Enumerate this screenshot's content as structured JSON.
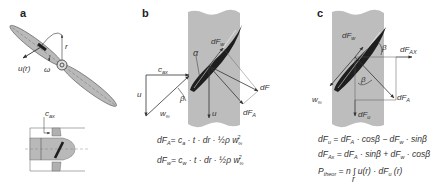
{
  "panels": {
    "a": {
      "label": "a",
      "labels": {
        "u": "u(r)",
        "omega": "ω",
        "r": "r",
        "cax": "c",
        "cax_sub": "ax"
      }
    },
    "b": {
      "label": "b",
      "labels": {
        "alpha": "α",
        "beta": "β",
        "dFw": "dF",
        "dFw_sub": "w",
        "dF": "dF",
        "dFA": "dF",
        "dFA_sub": "A",
        "cax": "c",
        "cax_sub": "ax",
        "u_left": "u",
        "u_blade": "u",
        "winf": "w",
        "winf_sub": "∞"
      },
      "equations": [
        {
          "lhs": "dF",
          "lhs_sub": "A",
          "rhs": "= c",
          "coef_sub": "a",
          "tail": " · t · dr · ",
          "half": "½",
          "rho": "ρ w",
          "w_sub": "∞",
          "w_sup": "2"
        },
        {
          "lhs": "dF",
          "lhs_sub": "w",
          "rhs": "= c",
          "coef_sub": "w",
          "tail": " · t · dr · ",
          "half": "½",
          "rho": "ρ w",
          "w_sub": "∞",
          "w_sup": "2"
        }
      ]
    },
    "c": {
      "label": "c",
      "labels": {
        "dFw": "dF",
        "dFw_sub": "w",
        "beta_top": "β",
        "dFAx": "dF",
        "dFAx_sub": "AX",
        "beta": "β",
        "winf": "w",
        "winf_sub": "∞",
        "dFA": "dF",
        "dFA_sub": "A",
        "dFu": "dF",
        "dFu_sub": "u"
      },
      "equations": [
        {
          "text": "dF",
          "sub1": "u",
          "rest": " = dF",
          "sub2": "A",
          "rest2": " · cosβ − dF",
          "sub3": "w",
          "rest3": " · sinβ"
        },
        {
          "text": "dF",
          "sub1": "Ax",
          "rest": " = dF",
          "sub2": "A",
          "rest2": " · sinβ + dF",
          "sub3": "w",
          "rest3": " · cosβ"
        },
        {
          "text": "P",
          "sub1": "theor",
          "rest": " = n ∫ u(r) · dF",
          "sub2": "u",
          "rest2": " (r)",
          "int_sub": "r"
        }
      ]
    }
  },
  "colors": {
    "stripe": "#bdbdbd",
    "blade": "#1e1e1e",
    "prop": "#b9b9b9",
    "line": "#333333"
  }
}
